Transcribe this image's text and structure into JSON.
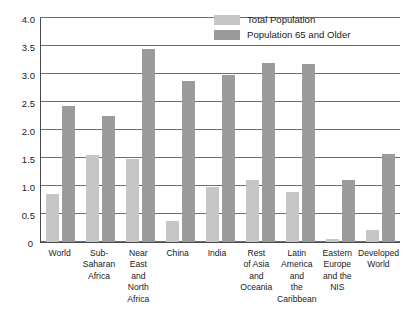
{
  "chart_data": {
    "type": "bar",
    "title": "",
    "xlabel": "",
    "ylabel": "",
    "ylim": [
      0,
      4.0
    ],
    "yticks": [
      "0",
      "0.5",
      "1.0",
      "1.5",
      "2.0",
      "2.5",
      "3.0",
      "3.5",
      "4.0"
    ],
    "ytick_values": [
      0,
      0.5,
      1.0,
      1.5,
      2.0,
      2.5,
      3.0,
      3.5,
      4.0
    ],
    "grid": true,
    "legend_position": "top-right",
    "categories": [
      "World",
      "Sub-Saharan Africa",
      "Near East and North Africa",
      "China",
      "India",
      "Rest of Asia and Oceania",
      "Latin America and the Caribbean",
      "Eastern Europe and the NIS",
      "Developed World"
    ],
    "category_lines": [
      [
        "World"
      ],
      [
        "Sub-",
        "Saharan",
        "Africa"
      ],
      [
        "Near",
        "East",
        "and North",
        "Africa"
      ],
      [
        "China"
      ],
      [
        "India"
      ],
      [
        "Rest",
        "of Asia",
        "and",
        "Oceania"
      ],
      [
        "Latin",
        "America",
        "and",
        "the",
        "Caribbean"
      ],
      [
        "Eastern",
        "Europe",
        "and the",
        "NIS"
      ],
      [
        "Developed",
        "World"
      ]
    ],
    "series": [
      {
        "name": "Total Population",
        "color": "#c6c6c6",
        "values": [
          0.85,
          1.55,
          1.48,
          0.38,
          0.98,
          1.1,
          0.9,
          0.05,
          0.22
        ]
      },
      {
        "name": "Population 65 and Older",
        "color": "#9b9b9b",
        "values": [
          2.42,
          2.25,
          3.45,
          2.88,
          2.98,
          3.2,
          3.17,
          1.1,
          1.58
        ]
      }
    ]
  },
  "legend": {
    "items": [
      {
        "label": "Total Population",
        "swatch": "total"
      },
      {
        "label": "Population 65 and Older",
        "swatch": "older"
      }
    ]
  }
}
